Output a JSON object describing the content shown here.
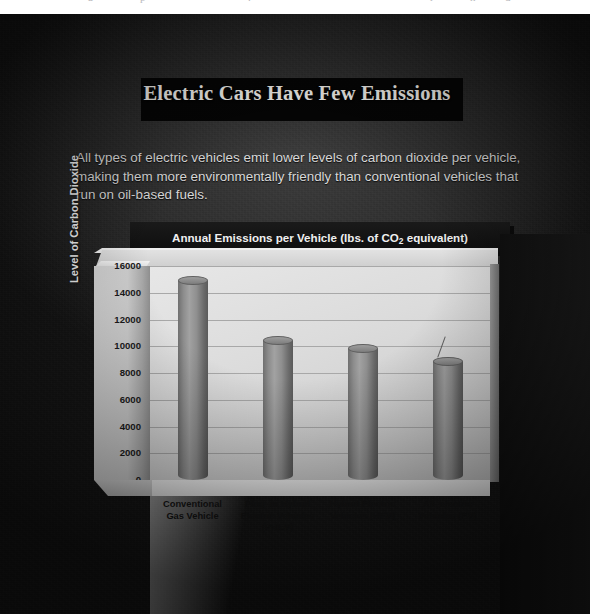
{
  "top_sliver": {
    "fragments": [
      "a",
      "p",
      ".",
      "r",
      "n",
      "d"
    ]
  },
  "headline": {
    "title": "Electric Cars Have Few Emissions"
  },
  "body": {
    "paragraph": "All types of electric vehicles emit lower levels of carbon dioxide per vehicle, making them more environmentally friendly than conventional vehicles that run on oil-based fuels."
  },
  "chart_banner": {
    "prefix": "Annual Emissions per Vehicle (lbs. of CO",
    "subscript": "2",
    "suffix": " equivalent)"
  },
  "chart_data": {
    "type": "bar",
    "title": "Annual Emissions per Vehicle (lbs. of CO2 equivalent)",
    "xlabel": "",
    "ylabel": "Level of Carbon Dioxide",
    "ylim": [
      0,
      16000
    ],
    "yticks": [
      16000,
      14000,
      12000,
      10000,
      8000,
      6000,
      4000,
      2000,
      0
    ],
    "grid": true,
    "legend": "none",
    "categories": [
      "Conventional Gas Vehicle",
      "Plug–in Hybrid Electric Vehicles (PHEV)",
      "Hybrid Electric Vehicles (HEV)",
      "All–electric Vehicles (EV)"
    ],
    "category_lines": [
      [
        "Conventional",
        "Gas Vehicle"
      ],
      [
        "Plug–in Hybrid",
        "Electric Vehicles",
        "(PHEV)"
      ],
      [
        "Hybrid Electric",
        "Vehicles (HEV)"
      ],
      [
        "All–electric",
        "Vehicles (EV)"
      ]
    ],
    "values": [
      14900,
      10400,
      9800,
      8800
    ],
    "bar_color": "#8c8c8c"
  },
  "colors": {
    "page_background": "#2e2e2e",
    "headline_text": "#f4f2ee",
    "body_text": "#d8d8d8",
    "plot_wall": "#dcdcdc",
    "banner_background": "#111111"
  }
}
